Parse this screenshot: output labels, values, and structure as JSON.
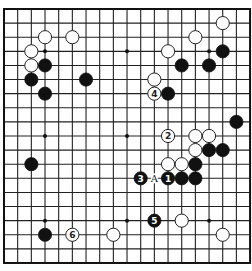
{
  "board": {
    "size": 19,
    "origin_x": 4,
    "origin_y": 9,
    "step_x": 13.67,
    "step_y": 14.11,
    "stone_radius": 6.6,
    "colors": {
      "line": "#222222",
      "black": "#111111",
      "white": "#ffffff",
      "background": "#ffffff"
    },
    "star_points": [
      [
        3,
        3
      ],
      [
        9,
        3
      ],
      [
        15,
        3
      ],
      [
        3,
        9
      ],
      [
        9,
        9
      ],
      [
        15,
        9
      ],
      [
        3,
        15
      ],
      [
        9,
        15
      ],
      [
        15,
        15
      ]
    ],
    "stones": [
      {
        "color": "white",
        "col": 3,
        "row": 2
      },
      {
        "color": "white",
        "col": 5,
        "row": 2
      },
      {
        "color": "white",
        "col": 2,
        "row": 3
      },
      {
        "color": "white",
        "col": 2,
        "row": 4
      },
      {
        "color": "black",
        "col": 3,
        "row": 4
      },
      {
        "color": "black",
        "col": 2,
        "row": 5
      },
      {
        "color": "black",
        "col": 6,
        "row": 5
      },
      {
        "color": "black",
        "col": 3,
        "row": 6
      },
      {
        "color": "white",
        "col": 16,
        "row": 1
      },
      {
        "color": "white",
        "col": 14,
        "row": 2
      },
      {
        "color": "white",
        "col": 12,
        "row": 3
      },
      {
        "color": "black",
        "col": 16,
        "row": 3
      },
      {
        "color": "black",
        "col": 13,
        "row": 4
      },
      {
        "color": "black",
        "col": 15,
        "row": 4
      },
      {
        "color": "white",
        "col": 11,
        "row": 5
      },
      {
        "color": "white",
        "col": 11,
        "row": 6,
        "label": "4"
      },
      {
        "color": "black",
        "col": 12,
        "row": 6
      },
      {
        "color": "black",
        "col": 17,
        "row": 8
      },
      {
        "color": "white",
        "col": 12,
        "row": 9,
        "label": "2"
      },
      {
        "color": "white",
        "col": 14,
        "row": 9
      },
      {
        "color": "white",
        "col": 15,
        "row": 9
      },
      {
        "color": "white",
        "col": 14,
        "row": 10
      },
      {
        "color": "black",
        "col": 15,
        "row": 10
      },
      {
        "color": "black",
        "col": 16,
        "row": 10
      },
      {
        "color": "black",
        "col": 2,
        "row": 11
      },
      {
        "color": "white",
        "col": 12,
        "row": 11
      },
      {
        "color": "white",
        "col": 13,
        "row": 11
      },
      {
        "color": "black",
        "col": 14,
        "row": 11
      },
      {
        "color": "black",
        "col": 10,
        "row": 12,
        "label": "3"
      },
      {
        "color": "black",
        "col": 12,
        "row": 12,
        "label": "1"
      },
      {
        "color": "black",
        "col": 13,
        "row": 12
      },
      {
        "color": "black",
        "col": 14,
        "row": 12
      },
      {
        "color": "black",
        "col": 11,
        "row": 15,
        "label": "5"
      },
      {
        "color": "white",
        "col": 13,
        "row": 15
      },
      {
        "color": "black",
        "col": 3,
        "row": 16
      },
      {
        "color": "white",
        "col": 5,
        "row": 16,
        "label": "6"
      },
      {
        "color": "white",
        "col": 8,
        "row": 16
      },
      {
        "color": "white",
        "col": 16,
        "row": 16
      }
    ],
    "markers": [
      {
        "col": 11,
        "row": 12,
        "text": "A"
      }
    ]
  }
}
